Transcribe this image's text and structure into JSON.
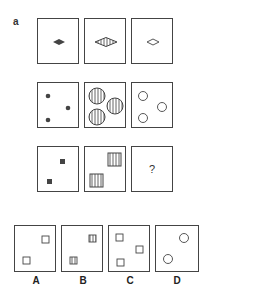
{
  "puzzle": {
    "label": "a",
    "question_mark": "?",
    "rows": [
      [
        "small solid diamond",
        "large striped diamond",
        "small outline diamond"
      ],
      [
        "three small solid dots",
        "three large striped circles",
        "three small outline circles"
      ],
      [
        "two small solid squares",
        "two large striped squares",
        "?"
      ]
    ],
    "options": [
      {
        "label": "A",
        "content": "two small outline squares"
      },
      {
        "label": "B",
        "content": "two small striped squares"
      },
      {
        "label": "C",
        "content": "three small outline squares"
      },
      {
        "label": "D",
        "content": "two small outline circles"
      }
    ]
  },
  "colors": {
    "stroke": "#444444",
    "fill": "#555555"
  }
}
